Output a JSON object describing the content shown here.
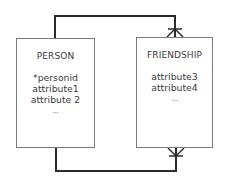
{
  "diagram": {
    "type": "entity-relationship",
    "notation": "crow's foot",
    "entities": [
      {
        "id": "person",
        "name": "PERSON",
        "attributes": [
          "*personid",
          "attribute1",
          "attribute 2",
          "..."
        ]
      },
      {
        "id": "friendship",
        "name": "FRIENDSHIP",
        "attributes": [
          "attribute3",
          "attribute4",
          "..."
        ]
      }
    ],
    "relationships": [
      {
        "from": "PERSON",
        "to": "FRIENDSHIP",
        "route": "top",
        "from_cardinality": "one",
        "to_cardinality": "many (crow's foot)"
      },
      {
        "from": "PERSON",
        "to": "FRIENDSHIP",
        "route": "bottom",
        "from_cardinality": "one",
        "to_cardinality": "many (crow's foot)"
      }
    ],
    "colors": {
      "connector": "#2b2b2b",
      "box_border": "#7a7a7a",
      "text": "#3a3a3a",
      "background": "#ffffff"
    }
  }
}
